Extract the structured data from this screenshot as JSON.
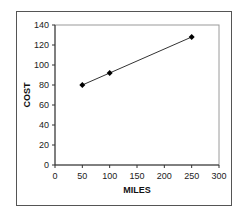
{
  "chart_data": {
    "type": "line",
    "title": "",
    "xlabel": "MILES",
    "ylabel": "COST",
    "x": [
      50,
      100,
      250
    ],
    "series": [
      {
        "name": "Cost",
        "values": [
          80,
          92,
          128
        ],
        "marker": "diamond",
        "color": "#000000"
      }
    ],
    "xlim": [
      0,
      300
    ],
    "ylim": [
      0,
      140
    ],
    "xticks": [
      0,
      50,
      100,
      150,
      200,
      250,
      300
    ],
    "yticks": [
      0,
      20,
      40,
      60,
      80,
      100,
      120,
      140
    ],
    "grid": false,
    "legend": false
  },
  "plot": {
    "left": 55,
    "right": 219,
    "top": 25,
    "bottom": 165
  }
}
